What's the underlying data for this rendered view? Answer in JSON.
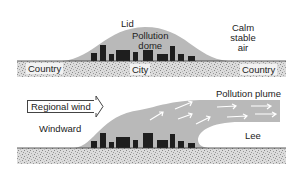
{
  "diagram": {
    "top_panel": {
      "labels": {
        "lid": "Lid",
        "pollution_dome": "Pollution\ndome",
        "pollution_dome_line1": "Pollution",
        "pollution_dome_line2": "dome",
        "calm_line1": "Calm",
        "calm_line2": "stable",
        "calm_line3": "air",
        "country_left": "Country",
        "city": "City",
        "country_right": "Country"
      }
    },
    "bottom_panel": {
      "labels": {
        "regional_wind": "Regional wind",
        "windward": "Windward",
        "pollution_plume": "Pollution plume",
        "lee": "Lee"
      }
    },
    "colors": {
      "dome_fill": "#b9b9b9",
      "building_fill": "#1e1e1e",
      "ground_fill": "#d6d6d6",
      "arrow_stroke": "#ffffff",
      "text": "#222222"
    }
  }
}
